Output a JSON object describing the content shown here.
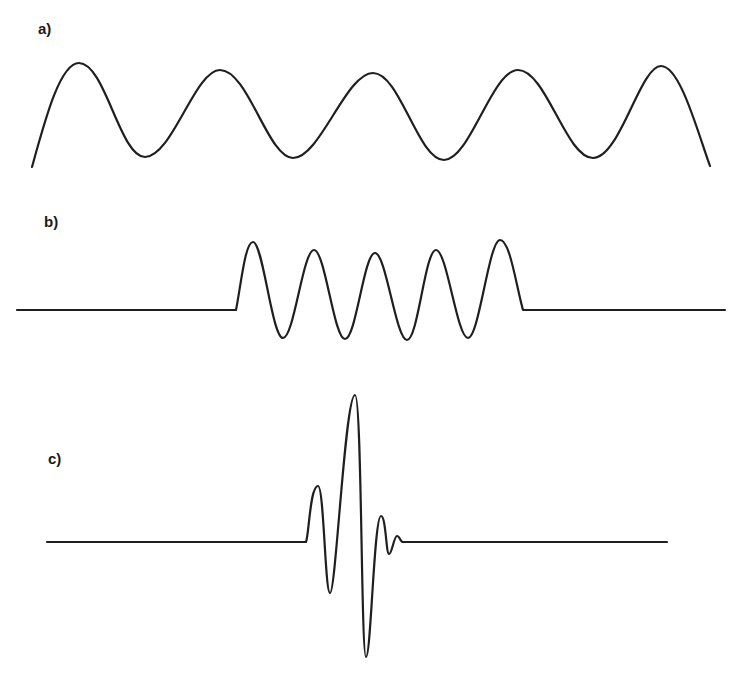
{
  "figure": {
    "panels": [
      {
        "id": "a",
        "label": "a)",
        "description": "Continuous sinusoid (infinite wave train)",
        "color": "#1f1f1f"
      },
      {
        "id": "b",
        "label": "b)",
        "description": "Truncated sinusoid (finite wave packet of 5 cycles)",
        "color": "#1f1f1f"
      },
      {
        "id": "c",
        "label": "c)",
        "description": "Short transient pulse (wavelet)",
        "color": "#1f1f1f"
      }
    ]
  }
}
